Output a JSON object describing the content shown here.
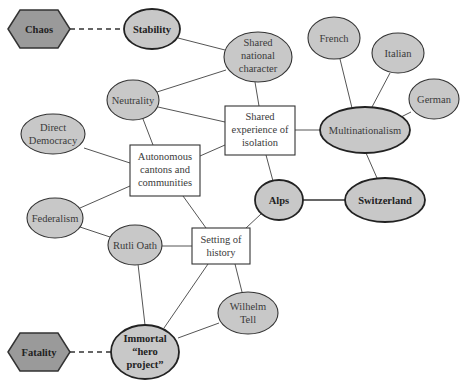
{
  "diagram": {
    "colors": {
      "node_fill": "#c8c8c8",
      "hex_fill": "#9a9a9a",
      "box_fill": "#ffffff",
      "stroke": "#333333",
      "edge": "#555555"
    },
    "nodes": {
      "chaos": {
        "label": "Chaos",
        "shape": "hexagon"
      },
      "fatality": {
        "label": "Fatality",
        "shape": "hexagon"
      },
      "stability": {
        "label": "Stability",
        "shape": "ellipse-bold"
      },
      "shared_national_character": {
        "lines": [
          "Shared",
          "national",
          "character"
        ],
        "shape": "ellipse"
      },
      "french": {
        "label": "French",
        "shape": "ellipse"
      },
      "italian": {
        "label": "Italian",
        "shape": "ellipse"
      },
      "german": {
        "label": "German",
        "shape": "ellipse"
      },
      "neutrality": {
        "label": "Neutrality",
        "shape": "ellipse"
      },
      "shared_experience": {
        "lines": [
          "Shared",
          "experience of",
          "isolation"
        ],
        "shape": "box"
      },
      "multinationalism": {
        "label": "Multinationalism",
        "shape": "ellipse-bold"
      },
      "direct_democracy": {
        "lines": [
          "Direct",
          "Democracy"
        ],
        "shape": "ellipse"
      },
      "autonomous_cantons": {
        "lines": [
          "Autonomous",
          "cantons and",
          "communities"
        ],
        "shape": "box"
      },
      "alps": {
        "label": "Alps",
        "shape": "ellipse-bold"
      },
      "switzerland": {
        "label": "Switzerland",
        "shape": "ellipse-bold"
      },
      "federalism": {
        "label": "Federalism",
        "shape": "ellipse"
      },
      "rutli_oath": {
        "label": "Rutli Oath",
        "shape": "ellipse"
      },
      "setting_of_history": {
        "lines": [
          "Setting of",
          "history"
        ],
        "shape": "box"
      },
      "wilhelm_tell": {
        "lines": [
          "Wilhelm",
          "Tell"
        ],
        "shape": "ellipse"
      },
      "immortal_hero_project": {
        "lines": [
          "Immortal",
          "“hero",
          "project”"
        ],
        "shape": "ellipse-bold"
      }
    },
    "edges": [
      {
        "from": "Chaos",
        "to": "Stability",
        "style": "dashed"
      },
      {
        "from": "Fatality",
        "to": "Immortal “hero project”",
        "style": "dashed"
      },
      {
        "from": "Stability",
        "to": "Shared national character",
        "style": "solid"
      },
      {
        "from": "Neutrality",
        "to": "Shared national character",
        "style": "solid"
      },
      {
        "from": "Shared national character",
        "to": "Shared experience of isolation",
        "style": "solid"
      },
      {
        "from": "Neutrality",
        "to": "Shared experience of isolation",
        "style": "solid"
      },
      {
        "from": "Neutrality",
        "to": "Autonomous cantons and communities",
        "style": "solid"
      },
      {
        "from": "Direct Democracy",
        "to": "Autonomous cantons and communities",
        "style": "solid"
      },
      {
        "from": "Autonomous cantons and communities",
        "to": "Shared experience of isolation",
        "style": "solid"
      },
      {
        "from": "Federalism",
        "to": "Autonomous cantons and communities",
        "style": "solid"
      },
      {
        "from": "Autonomous cantons and communities",
        "to": "Setting of history",
        "style": "solid"
      },
      {
        "from": "Shared experience of isolation",
        "to": "Multinationalism",
        "style": "solid"
      },
      {
        "from": "Shared experience of isolation",
        "to": "Alps",
        "style": "solid"
      },
      {
        "from": "French",
        "to": "Multinationalism",
        "style": "solid"
      },
      {
        "from": "Italian",
        "to": "Multinationalism",
        "style": "solid"
      },
      {
        "from": "German",
        "to": "Multinationalism",
        "style": "solid"
      },
      {
        "from": "Multinationalism",
        "to": "Switzerland",
        "style": "solid"
      },
      {
        "from": "Alps",
        "to": "Switzerland",
        "style": "bold"
      },
      {
        "from": "Alps",
        "to": "Setting of history",
        "style": "solid"
      },
      {
        "from": "Federalism",
        "to": "Rutli Oath",
        "style": "solid"
      },
      {
        "from": "Rutli Oath",
        "to": "Setting of history",
        "style": "solid"
      },
      {
        "from": "Rutli Oath",
        "to": "Immortal “hero project”",
        "style": "solid"
      },
      {
        "from": "Setting of history",
        "to": "Immortal “hero project”",
        "style": "solid"
      },
      {
        "from": "Setting of history",
        "to": "Wilhelm Tell",
        "style": "solid"
      },
      {
        "from": "Wilhelm Tell",
        "to": "Immortal “hero project”",
        "style": "solid"
      }
    ]
  }
}
